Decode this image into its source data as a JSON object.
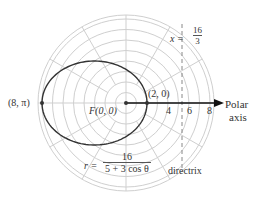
{
  "diagram": {
    "type": "polar-plot",
    "grid": {
      "rings": 8,
      "unit_px": 10.5,
      "spokes_deg": [
        0,
        30,
        60,
        90,
        120,
        150,
        180,
        210,
        240,
        270,
        300,
        330
      ],
      "color": "#cfcfcf"
    },
    "center_px": [
      126,
      103
    ],
    "curve": {
      "equation_lhs": "r =",
      "numerator": "16",
      "denominator": "5 + 3 cos θ",
      "eccentricity": 0.6,
      "color": "#333333"
    },
    "points": [
      {
        "label": "(8, π)",
        "r": 8,
        "theta": "π"
      },
      {
        "label": "F(0, 0)",
        "r": 0,
        "theta": "0"
      },
      {
        "label": "(2, 0)",
        "r": 2,
        "theta": "0"
      }
    ],
    "directrix": {
      "label": "directrix",
      "equation_lhs": "x =",
      "numerator": "16",
      "denominator": "3",
      "x_value": 5.3333
    },
    "polar_axis": {
      "label_line1": "Polar",
      "label_line2": "axis",
      "ticks": [
        "4",
        "6",
        "8"
      ]
    }
  }
}
